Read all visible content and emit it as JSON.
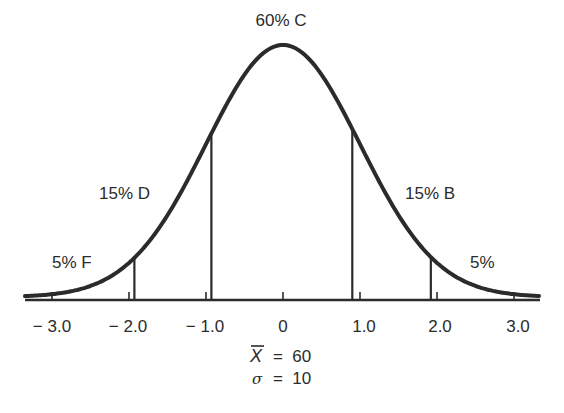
{
  "chart_data": {
    "type": "line",
    "title": "",
    "xlabel": "",
    "ylabel": "",
    "x_ticks": [
      -3.0,
      -2.0,
      -1.0,
      0,
      1.0,
      2.0,
      3.0
    ],
    "x_tick_labels": [
      "− 3.0",
      "− 2.0",
      "− 1.0",
      "0",
      "1.0",
      "2.0",
      "3.0"
    ],
    "xlim": [
      -3.35,
      3.35
    ],
    "grid": false,
    "dividers": [
      -1.93,
      -0.93,
      0.9,
      1.92
    ],
    "regions": [
      {
        "label": "5% F",
        "percent": 5,
        "grade": "F",
        "range": [
          -3.35,
          -1.93
        ]
      },
      {
        "label": "15% D",
        "percent": 15,
        "grade": "D",
        "range": [
          -1.93,
          -0.93
        ]
      },
      {
        "label": "60% C",
        "percent": 60,
        "grade": "C",
        "range": [
          -0.93,
          0.9
        ]
      },
      {
        "label": "15% B",
        "percent": 15,
        "grade": "B",
        "range": [
          0.9,
          1.92
        ]
      },
      {
        "label": "5%",
        "percent": 5,
        "grade": "",
        "range": [
          1.92,
          3.35
        ]
      }
    ],
    "annotations": {
      "mean_label": "X̄ = 60",
      "mean": 60,
      "sd_label": "σ = 10",
      "sd": 10
    }
  },
  "labels": {
    "c": "60% C",
    "d": "15% D",
    "b": "15% B",
    "f": "5% F",
    "a": "5%"
  },
  "stats": {
    "mean_symbol": "X",
    "mean_eq": "=  60",
    "sd_symbol": "σ",
    "sd_eq": "=  10"
  },
  "ticks": [
    "− 3.0",
    "− 2.0",
    "− 1.0",
    "0",
    "1.0",
    "2.0",
    "3.0"
  ],
  "colors": {
    "ink": "#2b2b2b",
    "background": "#ffffff"
  }
}
